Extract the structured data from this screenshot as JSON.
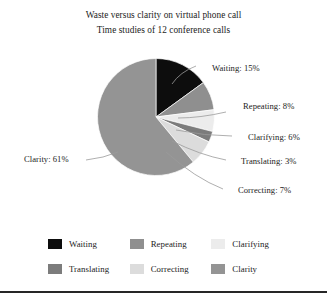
{
  "chart_data": {
    "type": "pie",
    "title": "Waste versus clarity on virtual phone call",
    "subtitle": "Time studies of 12 conference calls",
    "xlabel": "",
    "ylabel": "",
    "legend_position": "bottom",
    "grid": false,
    "start_angle_deg": 0,
    "direction": "clockwise",
    "categories": [
      "Waiting",
      "Repeating",
      "Clarifying",
      "Translating",
      "Correcting",
      "Clarity"
    ],
    "values": [
      15,
      8,
      6,
      3,
      7,
      61
    ],
    "unit": "%",
    "colors": [
      "#0d0d0d",
      "#8f8f8f",
      "#ececec",
      "#7c7c7c",
      "#dcdcdc",
      "#949494"
    ],
    "slices": [
      {
        "name": "Waiting",
        "value": 15,
        "label": "Waiting: 15%",
        "color": "#0d0d0d"
      },
      {
        "name": "Repeating",
        "value": 8,
        "label": "Repeating: 8%",
        "color": "#8f8f8f"
      },
      {
        "name": "Clarifying",
        "value": 6,
        "label": "Clarifying: 6%",
        "color": "#ececec"
      },
      {
        "name": "Translating",
        "value": 3,
        "label": "Translating: 3%",
        "color": "#7c7c7c"
      },
      {
        "name": "Correcting",
        "value": 7,
        "label": "Correcting: 7%",
        "color": "#dcdcdc"
      },
      {
        "name": "Clarity",
        "value": 61,
        "label": "Clarity: 61%",
        "color": "#949494"
      }
    ]
  },
  "titles": {
    "main": "Waste versus clarity on virtual phone call",
    "sub": "Time studies of 12 conference calls"
  },
  "labels": {
    "waiting": "Waiting: 15%",
    "repeating": "Repeating: 8%",
    "clarifying": "Clarifying: 6%",
    "translating": "Translating: 3%",
    "correcting": "Correcting: 7%",
    "clarity": "Clarity: 61%"
  },
  "legend": {
    "rows": [
      [
        {
          "label": "Waiting",
          "color": "#0d0d0d"
        },
        {
          "label": "Repeating",
          "color": "#8f8f8f"
        },
        {
          "label": "Clarifying",
          "color": "#ececec"
        }
      ],
      [
        {
          "label": "Translating",
          "color": "#7c7c7c"
        },
        {
          "label": "Correcting",
          "color": "#dcdcdc"
        },
        {
          "label": "Clarity",
          "color": "#949494"
        }
      ]
    ]
  }
}
